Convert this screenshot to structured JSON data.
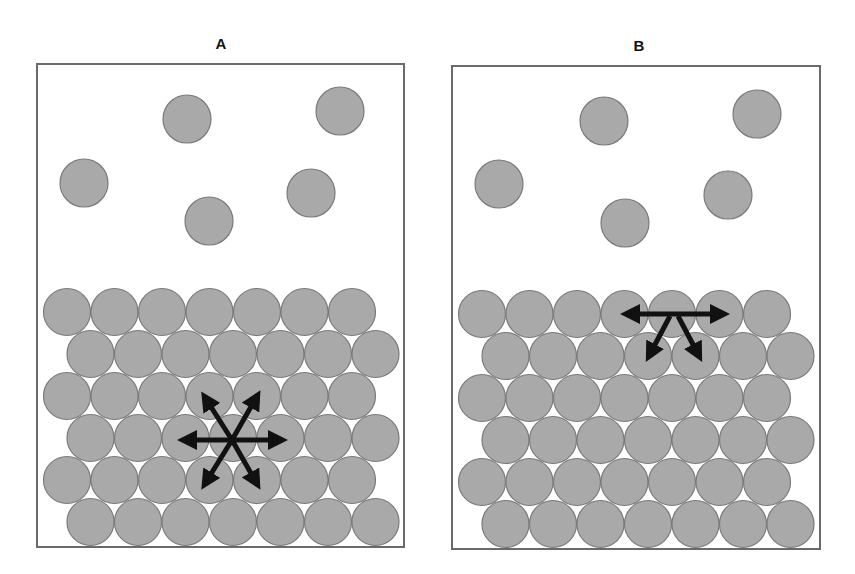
{
  "figure": {
    "colors": {
      "particle_fill": "#a9a9a9",
      "particle_stroke": "#7a7a7a",
      "box_stroke": "#6a6a6a",
      "arrow": "#111111",
      "background": "#ffffff"
    },
    "panels": [
      {
        "label": "A",
        "box": {
          "x": 37,
          "y": 64,
          "width": 367,
          "height": 483
        },
        "free_particles": [
          {
            "cx": 187,
            "cy": 119
          },
          {
            "cx": 340,
            "cy": 111
          },
          {
            "cx": 84,
            "cy": 183
          },
          {
            "cx": 209,
            "cy": 221
          },
          {
            "cx": 311,
            "cy": 193
          }
        ],
        "lattice": {
          "origin_x": 67,
          "origin_y": 312,
          "dx": 47.5,
          "dy": 42,
          "rows": 6,
          "cols": 7,
          "odd_row_offset": 23.5,
          "radius": 23.5
        },
        "arrow_type": "six-direction",
        "arrow_center": {
          "x": 232,
          "y": 440
        }
      },
      {
        "label": "B",
        "box": {
          "x": 452,
          "y": 66,
          "width": 368,
          "height": 483
        },
        "free_particles": [
          {
            "cx": 604,
            "cy": 121
          },
          {
            "cx": 757,
            "cy": 114
          },
          {
            "cx": 499,
            "cy": 184
          },
          {
            "cx": 625,
            "cy": 223
          },
          {
            "cx": 728,
            "cy": 195
          }
        ],
        "lattice": {
          "origin_x": 482,
          "origin_y": 314,
          "dx": 47.5,
          "dy": 42,
          "rows": 6,
          "cols": 7,
          "odd_row_offset": 23.5,
          "radius": 23.5
        },
        "arrow_type": "three-direction-surface",
        "arrow_center": {
          "x": 674,
          "y": 314
        }
      }
    ]
  }
}
